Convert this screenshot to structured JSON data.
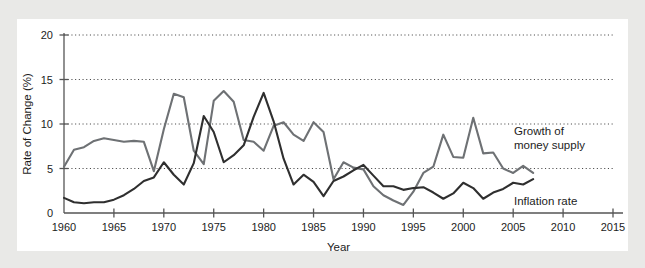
{
  "chart_data": {
    "type": "line",
    "title": "",
    "xlabel": "Year",
    "ylabel": "Rate of Change (%)",
    "xlim": [
      1960,
      2015
    ],
    "ylim": [
      0,
      20
    ],
    "xticks": [
      1960,
      1965,
      1970,
      1975,
      1980,
      1985,
      1990,
      1995,
      2000,
      2005,
      2010,
      2015
    ],
    "yticks": [
      0,
      5,
      10,
      15,
      20
    ],
    "grid": "horizontal-dotted",
    "legend": "inline-annotations",
    "x": [
      1960,
      1961,
      1962,
      1963,
      1964,
      1965,
      1966,
      1967,
      1968,
      1969,
      1970,
      1971,
      1972,
      1973,
      1974,
      1975,
      1976,
      1977,
      1978,
      1979,
      1980,
      1981,
      1982,
      1983,
      1984,
      1985,
      1986,
      1987,
      1988,
      1989,
      1990,
      1991,
      1992,
      1993,
      1994,
      1995,
      1996,
      1997,
      1998,
      1999,
      2000,
      2001,
      2002,
      2003,
      2004,
      2005,
      2006,
      2007
    ],
    "series": [
      {
        "name": "Growth of money supply",
        "color": "#6e7174",
        "values": [
          5.2,
          7.1,
          7.4,
          8.1,
          8.4,
          8.2,
          8.0,
          8.1,
          8.0,
          4.7,
          9.4,
          13.4,
          13.0,
          7.0,
          5.5,
          12.6,
          13.7,
          12.5,
          8.2,
          8.0,
          7.0,
          9.8,
          10.2,
          8.8,
          8.1,
          10.2,
          9.1,
          3.8,
          5.7,
          5.1,
          4.9,
          3.0,
          2.0,
          1.4,
          0.9,
          2.4,
          4.5,
          5.2,
          8.8,
          6.3,
          6.2,
          10.7,
          6.7,
          6.8,
          5.0,
          4.5,
          5.3,
          4.5
        ]
      },
      {
        "name": "Inflation rate",
        "color": "#2f2f2f",
        "values": [
          1.7,
          1.2,
          1.1,
          1.2,
          1.2,
          1.5,
          2.0,
          2.7,
          3.6,
          4.0,
          5.7,
          4.3,
          3.2,
          5.6,
          10.9,
          9.1,
          5.7,
          6.5,
          7.6,
          10.8,
          13.5,
          10.3,
          6.1,
          3.2,
          4.3,
          3.5,
          1.9,
          3.6,
          4.1,
          4.8,
          5.4,
          4.2,
          3.0,
          3.0,
          2.6,
          2.8,
          2.9,
          2.3,
          1.6,
          2.2,
          3.4,
          2.8,
          1.6,
          2.3,
          2.7,
          3.4,
          3.2,
          3.8
        ]
      }
    ],
    "annotations": [
      {
        "text_line1": "Growth of",
        "text_line2": "money supply"
      },
      {
        "text_line1": "Inflation rate"
      }
    ]
  }
}
